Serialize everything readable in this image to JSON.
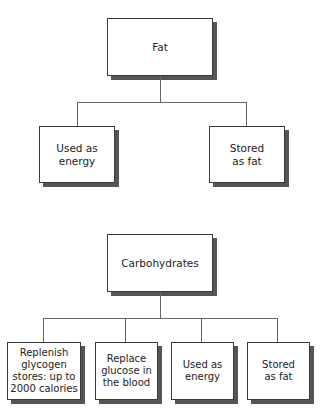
{
  "diagrams": [
    {
      "root": {
        "label": "Fat"
      },
      "children": [
        {
          "label": "Used as\nenergy"
        },
        {
          "label": "Stored\nas fat"
        }
      ]
    },
    {
      "root": {
        "label": "Carbohydrates"
      },
      "children": [
        {
          "label": "Replenish\nglycogen\nstores: up to\n2000 calories"
        },
        {
          "label": "Replace\nglucose in\nthe blood"
        },
        {
          "label": "Used as\nenergy"
        },
        {
          "label": "Stored\nas fat"
        }
      ]
    }
  ],
  "colors": {
    "border": "#3a3a3a",
    "shadow": "#555555",
    "line": "#666666"
  }
}
